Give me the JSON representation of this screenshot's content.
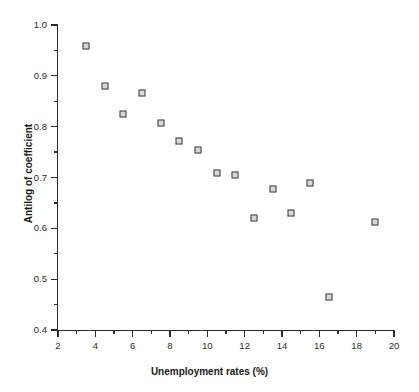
{
  "chart_data": {
    "type": "scatter",
    "title": "",
    "xlabel": "Unemployment rates (%)",
    "ylabel": "Antilog of coefficient",
    "xlim": [
      2,
      20
    ],
    "ylim": [
      0.4,
      1.0
    ],
    "grid": false,
    "legend": null,
    "x_ticks": [
      "2",
      "4",
      "6",
      "8",
      "10",
      "12",
      "14",
      "16",
      "18",
      "20"
    ],
    "x_tick_values": [
      2,
      4,
      6,
      8,
      10,
      12,
      14,
      16,
      18,
      20
    ],
    "x_minor_tick_values": [
      3,
      5,
      7,
      9,
      11,
      13,
      15,
      17,
      19
    ],
    "y_ticks": [
      "0.4",
      "0.5",
      "0.6",
      "0.7",
      "0.8",
      "0.9",
      "1.0"
    ],
    "y_tick_values": [
      0.4,
      0.5,
      0.6,
      0.7,
      0.8,
      0.9,
      1.0
    ],
    "y_minor_tick_values": [
      0.45,
      0.55,
      0.65,
      0.75,
      0.85,
      0.95
    ],
    "marker": "open-square",
    "marker_edge_color": "#3c3c3c",
    "marker_face_color": "#d8d8d8",
    "axis_color": "#2b2b2b",
    "background_color": "#ffffff",
    "points": [
      {
        "x": 3.5,
        "y": 0.958
      },
      {
        "x": 4.5,
        "y": 0.88
      },
      {
        "x": 5.5,
        "y": 0.825
      },
      {
        "x": 6.5,
        "y": 0.866
      },
      {
        "x": 7.5,
        "y": 0.807
      },
      {
        "x": 8.5,
        "y": 0.772
      },
      {
        "x": 9.5,
        "y": 0.755
      },
      {
        "x": 10.5,
        "y": 0.708
      },
      {
        "x": 11.5,
        "y": 0.705
      },
      {
        "x": 12.5,
        "y": 0.621
      },
      {
        "x": 13.5,
        "y": 0.677
      },
      {
        "x": 14.5,
        "y": 0.631
      },
      {
        "x": 15.5,
        "y": 0.689
      },
      {
        "x": 16.5,
        "y": 0.465
      },
      {
        "x": 19.0,
        "y": 0.613
      }
    ]
  }
}
